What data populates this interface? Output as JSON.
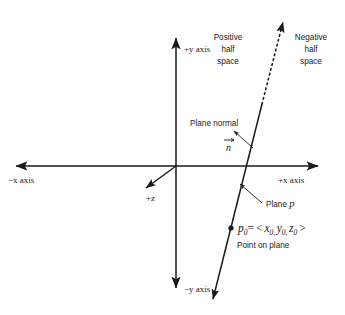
{
  "figure": {
    "kind": "geometry-diagram",
    "background_color": "#ffffff",
    "ink_color": "#1a1a1a"
  },
  "axes": {
    "x_negative_label": "−x axis",
    "x_positive_label": "+x axis",
    "y_positive_label": "+y axis",
    "y_negative_label": "−y axis",
    "z_positive_label": "+z"
  },
  "annotations": {
    "positive_half_space": [
      "Positive",
      "half",
      "space"
    ],
    "negative_half_space": [
      "Negative",
      "half",
      "space"
    ],
    "plane_normal_label": "Plane normal",
    "normal_vector_symbol": "n",
    "plane_label_prefix": "Plane ",
    "plane_label_symbol": "p",
    "point_equation": {
      "point_symbol": "p",
      "point_subscript": "0",
      "equals": "=",
      "open_bracket": "<",
      "components": [
        {
          "symbol": "x",
          "subscript": "0",
          "separator": ","
        },
        {
          "symbol": "y",
          "subscript": "0",
          "separator": ","
        },
        {
          "symbol": "z",
          "subscript": "0",
          "separator": ""
        }
      ],
      "close_bracket": ">"
    },
    "point_caption": "Point on plane"
  }
}
